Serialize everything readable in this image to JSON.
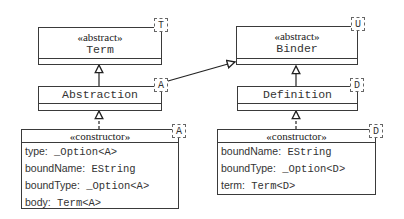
{
  "diagram": {
    "type": "uml-class-diagram",
    "classes": {
      "term": {
        "stereotype": "«abstract»",
        "name": "Term",
        "template_param": "T"
      },
      "binder": {
        "stereotype": "«abstract»",
        "name": "Binder",
        "template_param": "U"
      },
      "abstraction": {
        "name": "Abstraction",
        "template_param": "A"
      },
      "definition": {
        "name": "Definition",
        "template_param": "D"
      },
      "abstraction_ctor": {
        "stereotype": "«constructor»",
        "template_param": "A",
        "attributes": [
          {
            "label": "type:",
            "type": " _Option<A>"
          },
          {
            "label": "boundName:",
            "type": " EString"
          },
          {
            "label": "boundType:",
            "type": " _Option<A>"
          },
          {
            "label": "body:",
            "type": " Term<A>"
          }
        ]
      },
      "definition_ctor": {
        "stereotype": "«constructor»",
        "template_param": "D",
        "attributes": [
          {
            "label": "boundName:",
            "type": " EString"
          },
          {
            "label": "boundType:",
            "type": " _Option<D>"
          },
          {
            "label": "term:",
            "type": " Term<D>"
          }
        ]
      }
    },
    "relations": [
      {
        "from": "Abstraction",
        "to": "Term",
        "kind": "generalization"
      },
      {
        "from": "Definition",
        "to": "Binder",
        "kind": "generalization"
      },
      {
        "from": "Abstraction",
        "to": "Binder",
        "kind": "generalization"
      },
      {
        "from": "«constructor» A",
        "to": "Abstraction",
        "kind": "realization"
      },
      {
        "from": "«constructor» D",
        "to": "Definition",
        "kind": "realization"
      }
    ]
  }
}
